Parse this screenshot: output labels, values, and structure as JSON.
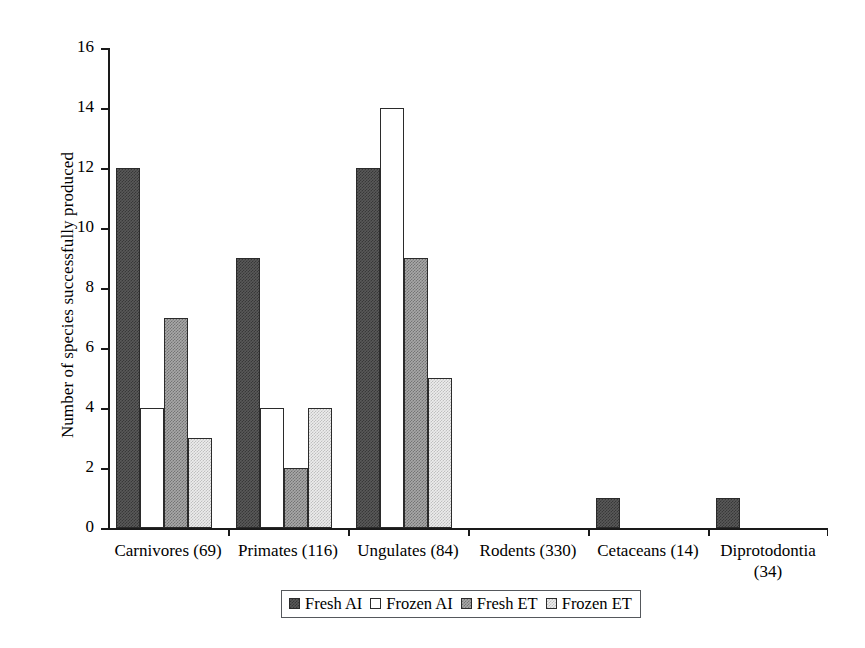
{
  "chart_data": {
    "type": "bar",
    "title": "",
    "xlabel": "",
    "ylabel": "Number of species successfully produced",
    "ylim": [
      0,
      16
    ],
    "ytick_values": [
      0,
      2,
      4,
      6,
      8,
      10,
      12,
      14,
      16
    ],
    "ytick_labels": [
      "0",
      "2",
      "4",
      "6",
      "8",
      "10",
      "12",
      "14",
      "16"
    ],
    "grid": false,
    "legend_position": "bottom-center",
    "categories": [
      "Carnivores (69)",
      "Primates (116)",
      "Ungulates (84)",
      "Rodents (330)",
      "Cetaceans (14)",
      "Diprotodontia (34)"
    ],
    "category_display": [
      "Carnivores (69)",
      "Primates (116)",
      "Ungulates (84)",
      "Rodents (330)",
      "Cetaceans (14)",
      "Diprotodontia\n(34)"
    ],
    "series": [
      {
        "name": "Fresh AI",
        "values": [
          12,
          9,
          12,
          0,
          1,
          1
        ],
        "fill": "dark-gray-dither",
        "color": "#595959"
      },
      {
        "name": "Frozen AI",
        "values": [
          4,
          4,
          14,
          0,
          0,
          0
        ],
        "fill": "white",
        "color": "#ffffff"
      },
      {
        "name": "Fresh ET",
        "values": [
          7,
          2,
          9,
          0,
          0,
          0
        ],
        "fill": "medium-gray-dither",
        "color": "#a8a8a8"
      },
      {
        "name": "Frozen ET",
        "values": [
          3,
          4,
          5,
          0,
          0,
          0
        ],
        "fill": "light-gray-dither",
        "color": "#ececec"
      }
    ]
  }
}
